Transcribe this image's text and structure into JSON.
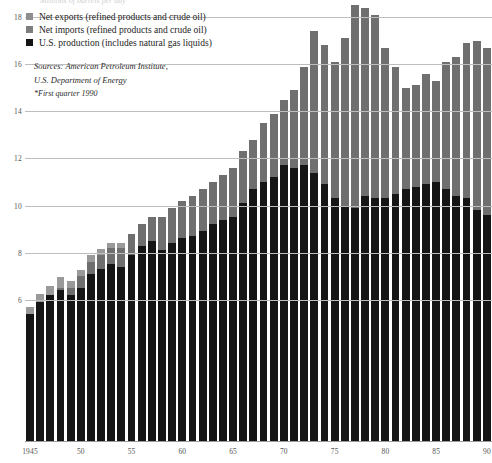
{
  "chart_data": {
    "type": "bar",
    "stacked": true,
    "title": "Millions of barrels per day",
    "xlabel": "",
    "ylabel": "",
    "ylim": [
      0,
      19
    ],
    "xlim_labels": [
      "1945",
      "90"
    ],
    "grid": true,
    "legend_position": "top-left",
    "yticks": [
      18,
      16,
      14,
      12,
      10,
      8,
      6
    ],
    "ytick_labels": [
      "18",
      "16",
      "14",
      "12",
      "10",
      "8",
      "6"
    ],
    "xtick_labels": [
      "1945",
      "50",
      "55",
      "60",
      "65",
      "70",
      "75",
      "80",
      "85",
      "90"
    ],
    "xtick_years": [
      1945,
      1950,
      1955,
      1960,
      1965,
      1970,
      1975,
      1980,
      1985,
      1990
    ],
    "categories": [
      1945,
      1946,
      1947,
      1948,
      1949,
      1950,
      1951,
      1952,
      1953,
      1954,
      1955,
      1956,
      1957,
      1958,
      1959,
      1960,
      1961,
      1962,
      1963,
      1964,
      1965,
      1966,
      1967,
      1968,
      1969,
      1970,
      1971,
      1972,
      1973,
      1974,
      1975,
      1976,
      1977,
      1978,
      1979,
      1980,
      1981,
      1982,
      1983,
      1984,
      1985,
      1986,
      1987,
      1988,
      1989,
      1990
    ],
    "series": [
      {
        "name": "U.S. production (includes natural gas liquids)",
        "color": "#151515",
        "values": [
          5.4,
          5.9,
          6.2,
          6.4,
          6.2,
          6.5,
          7.1,
          7.3,
          7.5,
          7.4,
          7.9,
          8.3,
          8.5,
          8.1,
          8.4,
          8.6,
          8.7,
          8.9,
          9.2,
          9.4,
          9.5,
          10.1,
          10.7,
          11.0,
          11.2,
          11.7,
          11.6,
          11.7,
          11.4,
          10.9,
          10.3,
          10.0,
          9.9,
          10.4,
          10.3,
          10.3,
          10.5,
          10.7,
          10.8,
          10.9,
          11.0,
          10.7,
          10.4,
          10.3,
          9.8,
          9.6
        ]
      },
      {
        "name": "Net imports (refined products and crude oil)",
        "color": "#6f6f6f",
        "values": [
          0.0,
          0.0,
          0.0,
          0.1,
          0.3,
          0.5,
          0.5,
          0.6,
          0.7,
          0.8,
          0.9,
          0.9,
          1.0,
          1.4,
          1.5,
          1.6,
          1.7,
          1.8,
          1.8,
          1.9,
          2.1,
          2.2,
          2.1,
          2.5,
          2.7,
          2.8,
          3.3,
          4.2,
          6.0,
          5.9,
          5.8,
          7.1,
          8.6,
          8.0,
          7.8,
          6.4,
          5.4,
          4.3,
          4.3,
          4.7,
          4.3,
          5.4,
          5.9,
          6.6,
          7.2,
          7.1
        ]
      },
      {
        "name": "Net exports (refined products and crude oil)",
        "color": "#9a9a9a",
        "values": [
          0.3,
          0.35,
          0.4,
          0.45,
          0.3,
          0.25,
          0.3,
          0.25,
          0.2,
          0.2,
          0.2,
          0.2,
          0.2,
          0.15,
          0.1,
          0.1,
          0.1,
          0.1,
          0.1,
          0.1,
          0.1,
          0.1,
          0.1,
          0.1,
          0.1,
          0.1,
          0.1,
          0.1,
          0.1,
          0.1,
          0.1,
          0.1,
          0.1,
          0.1,
          0.1,
          0.1,
          0.1,
          0.1,
          0.1,
          0.1,
          0.1,
          0.1,
          0.1,
          0.1,
          0.1,
          0.1
        ]
      }
    ],
    "annotations": {
      "sources_line_1": "Sources: American Petroleum Institute,",
      "sources_line_2": "U.S. Department of Energy",
      "footnote": "*First quarter 1990"
    }
  },
  "legend": {
    "items": [
      {
        "label": "Net exports (refined products and crude oil)",
        "swatch_class": "sw-exp"
      },
      {
        "label": "Net imports (refined products and crude oil)",
        "swatch_class": "sw-imp"
      },
      {
        "label": "U.S. production (includes natural gas liquids)",
        "swatch_class": "sw-prod"
      }
    ]
  },
  "colors": {
    "production": "#151515",
    "imports": "#6f6f6f",
    "exports": "#9a9a9a",
    "gridline": "#bdbdbd",
    "axis_text": "#555555",
    "background": "#ffffff"
  }
}
